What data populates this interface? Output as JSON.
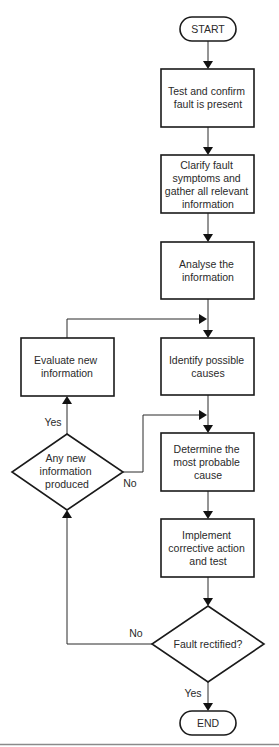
{
  "flowchart": {
    "start": "START",
    "end": "END",
    "steps": [
      {
        "id": "test_confirm",
        "lines": [
          "Test and confirm",
          "fault is present"
        ]
      },
      {
        "id": "clarify",
        "lines": [
          "Clarify fault",
          "symptoms and",
          "gather all relevant",
          "information"
        ]
      },
      {
        "id": "analyse",
        "lines": [
          "Analyse the",
          "information"
        ]
      },
      {
        "id": "identify",
        "lines": [
          "Identify possible",
          "causes"
        ]
      },
      {
        "id": "determine",
        "lines": [
          "Determine the",
          "most probable",
          "cause"
        ]
      },
      {
        "id": "implement",
        "lines": [
          "Implement",
          "corrective action",
          "and test"
        ]
      },
      {
        "id": "evaluate",
        "lines": [
          "Evaluate new",
          "information"
        ]
      }
    ],
    "decisions": [
      {
        "id": "any_new_info",
        "lines": [
          "Any new",
          "information",
          "produced"
        ],
        "yes_label": "Yes",
        "no_label": "No"
      },
      {
        "id": "fault_rectified",
        "lines": [
          "Fault rectified?"
        ],
        "yes_label": "Yes",
        "no_label": "No"
      }
    ]
  }
}
